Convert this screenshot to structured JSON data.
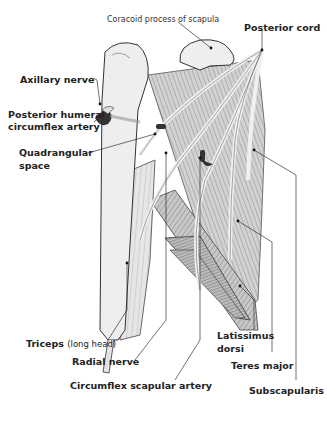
{
  "figure": {
    "labels": {
      "coracoid": "Coracoid process of scapula",
      "posterior_cord": "Posterior cord",
      "axillary_nerve": "Axillary nerve",
      "posterior_humeral_line1": "Posterior humeral",
      "posterior_humeral_line2": "circumflex artery",
      "quadrangular_line1": "Quadrangular",
      "quadrangular_line2": "space",
      "triceps": "Triceps",
      "triceps_sub": "(long head)",
      "radial_nerve": "Radial nerve",
      "circumflex_scapular": "Circumflex scapular artery",
      "latissimus_line1": "Latissimus",
      "latissimus_line2": "dorsi",
      "teres_major": "Teres major",
      "subscapularis": "Subscapularis"
    },
    "colors": {
      "ink": "#222222",
      "muscle": "#bdbdbd",
      "muscle_dark": "#8a8a8a",
      "bone": "#eeeeee",
      "nerve": "#e4e4e4",
      "artery": "#333333"
    }
  }
}
